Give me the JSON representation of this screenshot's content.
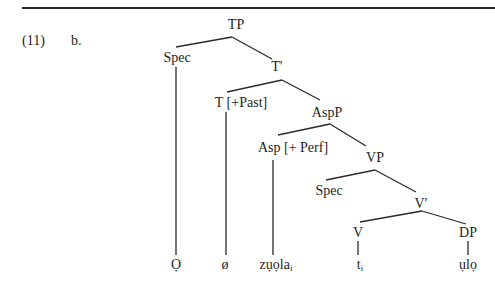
{
  "example": {
    "number": "(11)",
    "letter": "b."
  },
  "tree": {
    "nodes": {
      "tp": "TP",
      "spec_tp": "Spec",
      "t_bar": "T′",
      "t_head": "T [+Past]",
      "aspp": "AspP",
      "asp_head": "Asp [+ Perf]",
      "vp": "VP",
      "spec_vp": "Spec",
      "v_bar": "V′",
      "v_head": "V",
      "dp": "DP"
    },
    "leaves": {
      "spec_leaf": "Ọ",
      "t_leaf": "ø",
      "asp_leaf": "zụọla",
      "asp_leaf_index": "i",
      "v_leaf": "t",
      "v_leaf_index": "i",
      "dp_leaf": "ụlọ"
    }
  }
}
